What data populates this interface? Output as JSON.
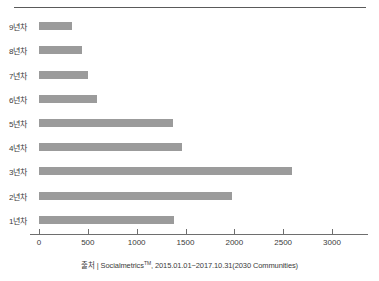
{
  "chart_data": {
    "type": "bar",
    "orientation": "horizontal",
    "title": "",
    "xlabel": "",
    "ylabel": "",
    "categories": [
      "9년차",
      "8년차",
      "7년차",
      "6년차",
      "5년차",
      "4년차",
      "3년차",
      "2년차",
      "1년차"
    ],
    "values": [
      340,
      440,
      500,
      595,
      1370,
      1460,
      2590,
      1975,
      1385
    ],
    "xlim": [
      0,
      3250
    ],
    "xticks": [
      0,
      500,
      1000,
      1500,
      2000,
      2500,
      3000
    ],
    "xtick_labels": [
      "0",
      "500",
      "1000",
      "1500",
      "2000",
      "2500",
      "3000"
    ],
    "grid": false,
    "legend": false,
    "bar_color": "#9b9b9b",
    "axis_color": "#6e6e6e"
  },
  "source": {
    "prefix": "출처 | Socialmetrics",
    "tm": "TM",
    "suffix": ", 2015.01.01~2017.10.31(2030 Communities)"
  }
}
